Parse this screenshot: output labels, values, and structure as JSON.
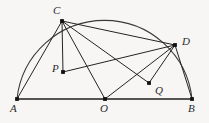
{
  "figure": {
    "background_color": "#f7f6f4",
    "stroke_color": "#242424",
    "label_color": "#2b2b2b",
    "width": 209,
    "height": 123,
    "points": [
      {
        "id": "A",
        "label": "A",
        "x": 17,
        "y": 99,
        "label_x": 10,
        "label_y": 103,
        "dot": true
      },
      {
        "id": "B",
        "label": "B",
        "x": 192,
        "y": 99,
        "label_x": 188,
        "label_y": 103,
        "dot": true
      },
      {
        "id": "C",
        "label": "C",
        "x": 62,
        "y": 21,
        "label_x": 53,
        "label_y": 5,
        "dot": true
      },
      {
        "id": "D",
        "label": "D",
        "x": 175,
        "y": 45,
        "label_x": 182,
        "label_y": 36,
        "dot": true
      },
      {
        "id": "O",
        "label": "O",
        "x": 105,
        "y": 99,
        "label_x": 100,
        "label_y": 103,
        "dot": true
      },
      {
        "id": "P",
        "label": "P",
        "x": 63,
        "y": 72,
        "label_x": 52,
        "label_y": 63,
        "dot": true
      },
      {
        "id": "Q",
        "label": "Q",
        "x": 149,
        "y": 83,
        "label_x": 155,
        "label_y": 85,
        "dot": true
      }
    ],
    "segments": [
      {
        "name": "segment-A-B",
        "from": "A",
        "to": "B",
        "kind": "baseline"
      },
      {
        "name": "segment-A-C",
        "from": "A",
        "to": "C",
        "kind": "chord"
      },
      {
        "name": "segment-C-P",
        "from": "C",
        "to": "P",
        "kind": "chord"
      },
      {
        "name": "segment-C-O",
        "from": "C",
        "to": "O",
        "kind": "chord"
      },
      {
        "name": "segment-C-Q",
        "from": "C",
        "to": "Q",
        "kind": "chord"
      },
      {
        "name": "segment-C-D",
        "from": "C",
        "to": "D",
        "kind": "chord"
      },
      {
        "name": "segment-P-D",
        "from": "P",
        "to": "D",
        "kind": "chord"
      },
      {
        "name": "segment-O-D",
        "from": "O",
        "to": "D",
        "kind": "chord"
      },
      {
        "name": "segment-Q-D",
        "from": "Q",
        "to": "D",
        "kind": "chord"
      },
      {
        "name": "segment-D-B",
        "from": "D",
        "to": "B",
        "kind": "chord"
      }
    ],
    "arc": {
      "name": "semicircle-arc",
      "center_x": 105,
      "center_y": 99,
      "radius": 88,
      "from": "A",
      "to": "B",
      "description": "semicircular arc from A through C and D to B"
    }
  }
}
